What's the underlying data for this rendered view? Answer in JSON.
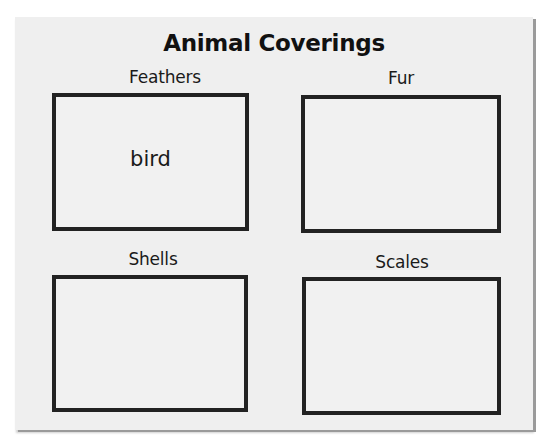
{
  "worksheet": {
    "title": "Animal Coverings",
    "categories": [
      {
        "label": "Feathers",
        "entries": [
          "bird"
        ]
      },
      {
        "label": "Fur",
        "entries": []
      },
      {
        "label": "Shells",
        "entries": []
      },
      {
        "label": "Scales",
        "entries": []
      }
    ]
  },
  "colors": {
    "paper": "#efefef",
    "ink": "#222222",
    "background": "#ffffff"
  }
}
